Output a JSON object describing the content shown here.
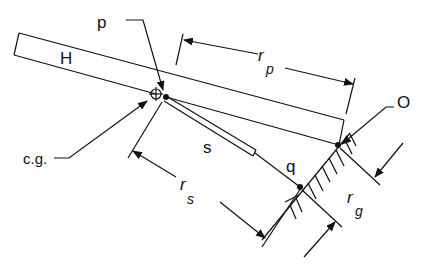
{
  "diagram": {
    "labels": {
      "p": "p",
      "H": "H",
      "rp_main": "r",
      "rp_sub": "p",
      "O": "O",
      "cg": "c.g.",
      "s": "s",
      "q": "q",
      "rs_main": "r",
      "rs_sub": "s",
      "rg_main": "r",
      "rg_sub": "g"
    },
    "colors": {
      "stroke": "#111111",
      "background": "#ffffff"
    }
  }
}
